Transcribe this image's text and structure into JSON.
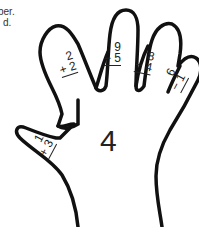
{
  "instructions": {
    "line1": "ber.",
    "line2": "d."
  },
  "answer": "4",
  "fingers": [
    {
      "finger": "thumb",
      "top": "1",
      "op": "+",
      "bottom": "3"
    },
    {
      "finger": "index",
      "top": "2",
      "op": "+",
      "bottom": "2"
    },
    {
      "finger": "middle",
      "top": "9",
      "op": "−",
      "bottom": "5"
    },
    {
      "finger": "ring",
      "top": "8",
      "op": "−",
      "bottom": "4"
    },
    {
      "finger": "pinky",
      "top": "6",
      "op": "−",
      "bottom": "1"
    }
  ],
  "labels": {
    "thumb_bottom": "+ 3",
    "index_bottom": "+ 2",
    "middle_bottom": "− 5",
    "ring_bottom": "− 4",
    "pinky_bottom": "− 1"
  },
  "colors": {
    "outline": "#111111",
    "text": "#222222"
  }
}
